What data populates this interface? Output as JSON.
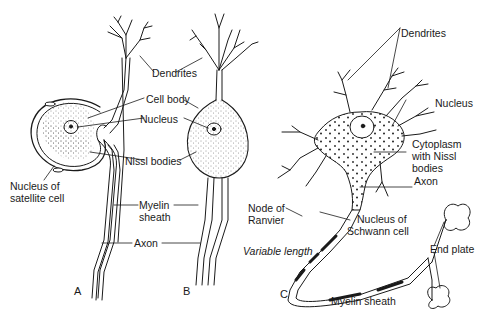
{
  "diagram": {
    "panels": [
      {
        "id": "A",
        "label": "A"
      },
      {
        "id": "B",
        "label": "B"
      },
      {
        "id": "C",
        "label": "C"
      }
    ],
    "labels": {
      "dendrites_ab": "Dendrites",
      "cell_body": "Cell body",
      "nucleus_ab": "Nucleus",
      "nissl_bodies": "Nissl bodies",
      "nucleus_satellite_1": "Nucleus of",
      "nucleus_satellite_2": "satellite cell",
      "myelin_sheath_ab_1": "Myelin",
      "myelin_sheath_ab_2": "sheath",
      "axon_ab": "Axon",
      "dendrites_c": "Dendrites",
      "nucleus_c": "Nucleus",
      "cytoplasm_1": "Cytoplasm",
      "cytoplasm_2": "with Nissl",
      "cytoplasm_3": "bodies",
      "axon_c": "Axon",
      "node_ranvier_1": "Node of",
      "node_ranvier_2": "Ranvier",
      "schwann_1": "Nucleus of",
      "schwann_2": "Schwann cell",
      "variable_length": "Variable length",
      "end_plate": "End plate",
      "myelin_sheath_c": "Myelin sheath"
    },
    "colors": {
      "ink": "#1a1a1a",
      "background": "#ffffff"
    }
  }
}
